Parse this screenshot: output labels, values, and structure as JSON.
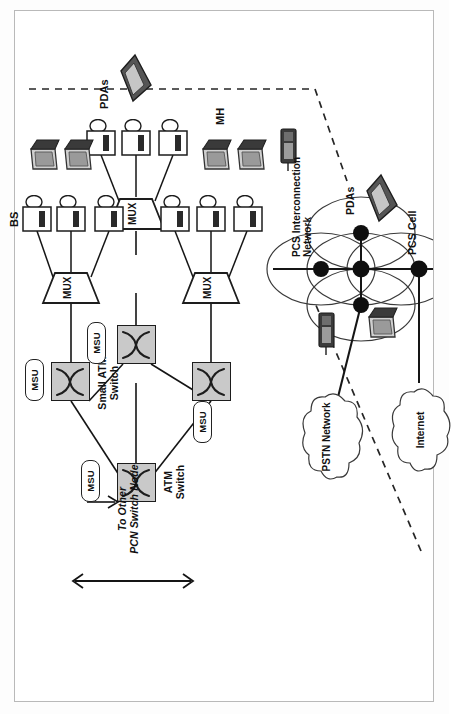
{
  "figure": {
    "orientation": "rotated-90-ccw",
    "border_color": "#b9b9b9",
    "switch_fill": "#c9c9c9",
    "ink": "#111111"
  },
  "backbone": {
    "to_other_label": "To Other\nPCN Switch Node",
    "atm_switch_label": "ATM\nSwitch",
    "small_atm_switch_label": "Small ATM\nSwitch",
    "msu_label": "MSU",
    "msu_count": 4,
    "mux_label": "MUX",
    "mux_count": 3
  },
  "endpoints": {
    "bs_label": "BS",
    "mh_label": "MH",
    "pdas_label": "PDAs",
    "bs_per_mux": 3
  },
  "access": {
    "pcs_interconnection_label": "PCS Interconnection\nNetwork",
    "pcs_cell_label": "PCS Cell",
    "pdas_label": "PDAs",
    "pstn_label": "PSTN\nNetwork",
    "internet_label": "Internet"
  },
  "icons": {
    "switch_icon": "cross-connect-icon",
    "mux_icon": "trapezoid-mux-icon",
    "bs_icon": "base-station-icon",
    "laptop_icon": "laptop-icon",
    "pda_icon": "pda-icon",
    "phone_icon": "mobile-phone-icon",
    "cloud_icon": "cloud-icon",
    "node_icon": "filled-node-icon",
    "cell_icon": "cell-ellipse-icon",
    "arrow_icon": "double-arrow-icon",
    "dashed_icon": "dashed-boundary-icon"
  }
}
